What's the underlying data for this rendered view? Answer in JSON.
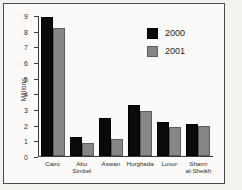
{
  "figure": {
    "source_credit": "Source: Convention, HEPD",
    "y_axis_label": "Millions"
  },
  "legend": {
    "position": "inside-top-right",
    "entries": [
      {
        "label": "2000",
        "color": "#0b0b0b"
      },
      {
        "label": "2001",
        "color": "#868686"
      }
    ]
  },
  "chart_data": {
    "type": "bar",
    "title": "",
    "xlabel": "",
    "ylabel": "Millions",
    "ylim": [
      0,
      9
    ],
    "ytick_labels": [
      "0",
      "1",
      "2",
      "3",
      "4",
      "5",
      "6",
      "7",
      "8",
      "9"
    ],
    "yticks": [
      0,
      1,
      2,
      3,
      4,
      5,
      6,
      7,
      8,
      9
    ],
    "grid": false,
    "categories": [
      "Cairo",
      "Abu Simbel",
      "Aswan",
      "Hurghada",
      "Luxor",
      "Sharm al-Sheikh"
    ],
    "category_lines": [
      [
        "Cairo"
      ],
      [
        "Abu",
        "Simbel"
      ],
      [
        "Aswan"
      ],
      [
        "Hurghada"
      ],
      [
        "Luxor"
      ],
      [
        "Sharm",
        "al-Sheikh"
      ]
    ],
    "series": [
      {
        "name": "2000",
        "color": "#0b0b0b",
        "values": [
          8.9,
          1.2,
          2.4,
          3.25,
          2.2,
          2.05
        ]
      },
      {
        "name": "2001",
        "color": "#868686",
        "values": [
          8.2,
          0.8,
          1.1,
          2.9,
          1.85,
          1.9
        ]
      }
    ]
  }
}
